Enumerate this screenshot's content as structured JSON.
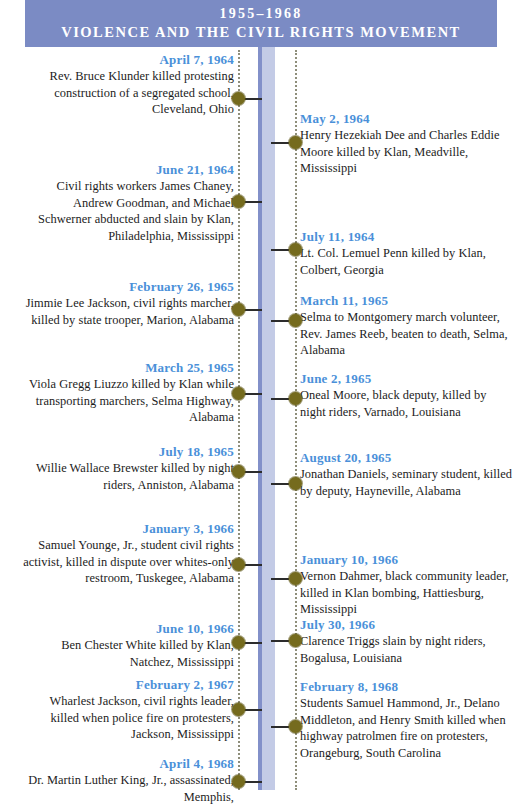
{
  "header": {
    "years": "1955–1968",
    "subtitle": "VIOLENCE AND THE CIVIL RIGHTS MOVEMENT"
  },
  "colors": {
    "banner_bg": "#7b8bc4",
    "spine_fill": "#c3cbe6",
    "spine_edge": "#8290c9",
    "date_text": "#4a90d9",
    "node_dot": "#756b1e",
    "body_text": "#1c1c1c"
  },
  "timeline": {
    "left_entries": [
      {
        "date": "April 7, 1964",
        "description": "Rev. Bruce Klunder killed protesting construction of a segregated school, Cleveland, Ohio"
      },
      {
        "date": "June 21, 1964",
        "description": "Civil rights workers James Chaney, Andrew Goodman, and Michael Schwerner abducted and slain by Klan, Philadelphia, Mississippi"
      },
      {
        "date": "February 26, 1965",
        "description": "Jimmie Lee Jackson, civil rights marcher, killed by state trooper, Marion, Alabama"
      },
      {
        "date": "March 25, 1965",
        "description": "Viola Gregg Liuzzo killed by Klan while transporting marchers, Selma Highway, Alabama"
      },
      {
        "date": "July 18, 1965",
        "description": "Willie Wallace Brewster killed by night riders, Anniston, Alabama"
      },
      {
        "date": "January 3, 1966",
        "description": "Samuel Younge, Jr., student civil rights activist, killed in dispute over whites-only restroom, Tuskegee, Alabama"
      },
      {
        "date": "June 10, 1966",
        "description": "Ben Chester White killed by Klan, Natchez, Mississippi"
      },
      {
        "date": "February 2, 1967",
        "description": "Wharlest Jackson, civil rights leader, killed when police fire on protesters, Jackson, Mississippi"
      },
      {
        "date": "April 4, 1968",
        "description": "Dr. Martin Luther King, Jr., assassinated, Memphis,"
      }
    ],
    "right_entries": [
      {
        "date": "May 2, 1964",
        "description": "Henry Hezekiah Dee and Charles Eddie Moore killed by Klan, Meadville, Mississippi"
      },
      {
        "date": "July 11, 1964",
        "description": "Lt. Col. Lemuel Penn killed by Klan, Colbert, Georgia"
      },
      {
        "date": "March 11, 1965",
        "description": "Selma to Montgomery march volunteer, Rev. James Reeb, beaten to death, Selma, Alabama"
      },
      {
        "date": "June 2, 1965",
        "description": "Oneal Moore, black deputy, killed by night riders, Varnado, Louisiana"
      },
      {
        "date": "August 20, 1965",
        "description": "Jonathan Daniels, seminary student, killed by deputy, Hayneville, Alabama"
      },
      {
        "date": "January 10, 1966",
        "description": "Vernon Dahmer, black community leader, killed in Klan bombing, Hattiesburg, Mississippi"
      },
      {
        "date": "July 30, 1966",
        "description": "Clarence Triggs slain by night riders, Bogalusa, Louisiana"
      },
      {
        "date": "February 8, 1968",
        "description": "Students Samuel Hammond, Jr., Delano Middleton, and Henry Smith killed when highway patrolmen fire on protesters, Orangeburg, South Carolina"
      }
    ]
  }
}
